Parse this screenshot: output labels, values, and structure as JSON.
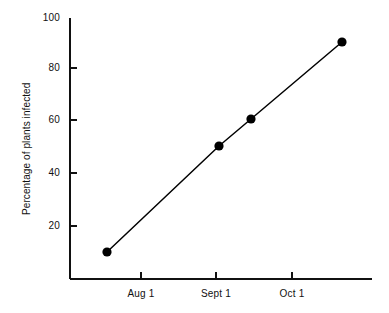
{
  "chart_data": {
    "type": "line",
    "title": "",
    "subtitle": "",
    "xlabel": "",
    "ylabel": "Percentage of plants infected",
    "ylim": [
      0,
      100
    ],
    "grid": false,
    "legend": null,
    "y_ticks": [
      {
        "value": 100,
        "label": "100"
      },
      {
        "value": 80,
        "label": "80"
      },
      {
        "value": 60,
        "label": "60"
      },
      {
        "value": 40,
        "label": "40"
      },
      {
        "value": 20,
        "label": "20"
      }
    ],
    "x_ticks": [
      {
        "label": "Aug 1",
        "month_index": 1
      },
      {
        "label": "Sept 1",
        "month_index": 2
      },
      {
        "label": "Oct 1",
        "month_index": 3
      }
    ],
    "x_tick_direction": "inward",
    "y_tick_direction": "inward",
    "series": [
      {
        "name": "Percentage of plants infected",
        "marker": "filled-circle",
        "color": "#000000",
        "points": [
          {
            "x_label": "Jul 16",
            "y": 10
          },
          {
            "x_label": "Sept 3",
            "y": 51
          },
          {
            "x_label": "Sept 14",
            "y": 61
          },
          {
            "x_label": "Oct 19",
            "y": 91
          }
        ]
      }
    ],
    "axis_color": "#111111",
    "background_color": "#ffffff"
  },
  "geometry": {
    "plot_left": 70,
    "plot_right": 372,
    "plot_top": 18,
    "plot_bottom": 279,
    "y_tick_y": [
      18,
      68,
      120,
      173,
      226
    ],
    "x_tick_x": [
      141,
      216,
      292
    ],
    "point_px": [
      {
        "x": 107,
        "y": 252
      },
      {
        "x": 219,
        "y": 146
      },
      {
        "x": 251,
        "y": 119
      },
      {
        "x": 342,
        "y": 42
      }
    ],
    "tick_len": 7,
    "marker_r": 4.6
  }
}
